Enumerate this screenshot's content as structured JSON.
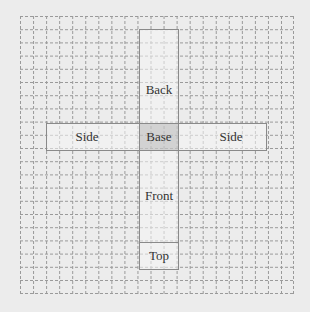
{
  "diagram": {
    "type": "cube-net",
    "grid": {
      "cols": 21,
      "rows": 21,
      "cell_px": 13,
      "line_style": "dashed",
      "line_color": "#9a9a9a"
    },
    "faces": [
      {
        "id": "back",
        "label": "Back"
      },
      {
        "id": "side-left",
        "label": "Side"
      },
      {
        "id": "base",
        "label": "Base"
      },
      {
        "id": "side-right",
        "label": "Side"
      },
      {
        "id": "front",
        "label": "Front"
      },
      {
        "id": "top",
        "label": "Top"
      }
    ],
    "colors": {
      "background": "#ececec",
      "face_fill": "#eeeeee",
      "base_fill": "#d6d6d6",
      "face_border": "#8a8a8a"
    }
  }
}
